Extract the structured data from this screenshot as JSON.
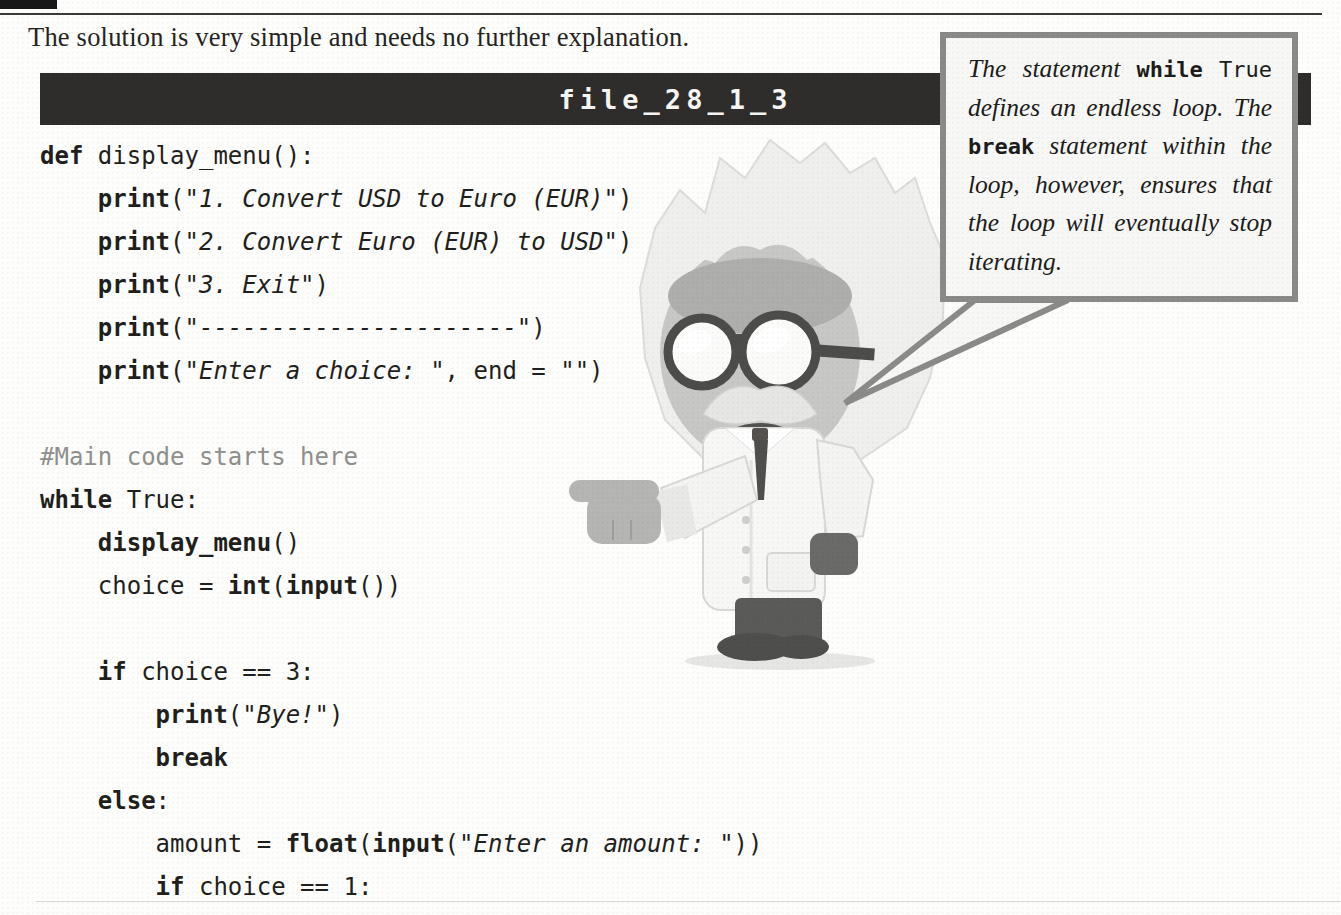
{
  "page": {
    "intro": "The solution is very simple and needs no further explanation.",
    "listing": {
      "title": "file_28_1_3",
      "language": "python",
      "lines": [
        [
          {
            "s": "kw",
            "t": "def"
          },
          {
            "s": "pl",
            "t": " display_menu():"
          }
        ],
        [
          {
            "s": "pl",
            "t": "    "
          },
          {
            "s": "kw",
            "t": "print"
          },
          {
            "s": "pl",
            "t": "(\""
          },
          {
            "s": "str",
            "t": "1. Convert USD to Euro (EUR)"
          },
          {
            "s": "pl",
            "t": "\")"
          }
        ],
        [
          {
            "s": "pl",
            "t": "    "
          },
          {
            "s": "kw",
            "t": "print"
          },
          {
            "s": "pl",
            "t": "(\""
          },
          {
            "s": "str",
            "t": "2. Convert Euro (EUR) to USD"
          },
          {
            "s": "pl",
            "t": "\")"
          }
        ],
        [
          {
            "s": "pl",
            "t": "    "
          },
          {
            "s": "kw",
            "t": "print"
          },
          {
            "s": "pl",
            "t": "(\""
          },
          {
            "s": "str",
            "t": "3. Exit"
          },
          {
            "s": "pl",
            "t": "\")"
          }
        ],
        [
          {
            "s": "pl",
            "t": "    "
          },
          {
            "s": "kw",
            "t": "print"
          },
          {
            "s": "pl",
            "t": "(\""
          },
          {
            "s": "str",
            "t": "----------------------"
          },
          {
            "s": "pl",
            "t": "\")"
          }
        ],
        [
          {
            "s": "pl",
            "t": "    "
          },
          {
            "s": "kw",
            "t": "print"
          },
          {
            "s": "pl",
            "t": "(\""
          },
          {
            "s": "str",
            "t": "Enter a choice: "
          },
          {
            "s": "pl",
            "t": "\", end = \"\")"
          }
        ],
        [],
        [
          {
            "s": "cmt",
            "t": "#Main code starts here"
          }
        ],
        [
          {
            "s": "kw",
            "t": "while"
          },
          {
            "s": "pl",
            "t": " True:"
          }
        ],
        [
          {
            "s": "pl",
            "t": "    "
          },
          {
            "s": "kw",
            "t": "display_menu"
          },
          {
            "s": "pl",
            "t": "()"
          }
        ],
        [
          {
            "s": "pl",
            "t": "    choice = "
          },
          {
            "s": "kw",
            "t": "int"
          },
          {
            "s": "pl",
            "t": "("
          },
          {
            "s": "kw",
            "t": "input"
          },
          {
            "s": "pl",
            "t": "())"
          }
        ],
        [],
        [
          {
            "s": "pl",
            "t": "    "
          },
          {
            "s": "kw",
            "t": "if"
          },
          {
            "s": "pl",
            "t": " choice == 3:"
          }
        ],
        [
          {
            "s": "pl",
            "t": "        "
          },
          {
            "s": "kw",
            "t": "print"
          },
          {
            "s": "pl",
            "t": "(\""
          },
          {
            "s": "str",
            "t": "Bye!"
          },
          {
            "s": "pl",
            "t": "\")"
          }
        ],
        [
          {
            "s": "pl",
            "t": "        "
          },
          {
            "s": "kw",
            "t": "break"
          }
        ],
        [
          {
            "s": "pl",
            "t": "    "
          },
          {
            "s": "kw",
            "t": "else"
          },
          {
            "s": "pl",
            "t": ":"
          }
        ],
        [
          {
            "s": "pl",
            "t": "        amount = "
          },
          {
            "s": "kw",
            "t": "float"
          },
          {
            "s": "pl",
            "t": "("
          },
          {
            "s": "kw",
            "t": "input"
          },
          {
            "s": "pl",
            "t": "(\""
          },
          {
            "s": "str",
            "t": "Enter an amount: "
          },
          {
            "s": "pl",
            "t": "\"))"
          }
        ],
        [
          {
            "s": "pl",
            "t": "        "
          },
          {
            "s": "kw",
            "t": "if"
          },
          {
            "s": "pl",
            "t": " choice == 1:"
          }
        ]
      ]
    },
    "bubble": {
      "full_text": "The statement while True defines an endless loop. The break statement within the loop, however, ensures that the loop will eventually stop iterating.",
      "lines": [
        {
          "tokens": [
            {
              "s": "i",
              "t": "The"
            },
            {
              "s": "i",
              "t": "statement"
            },
            {
              "s": "bm",
              "t": "while"
            },
            {
              "s": "m",
              "t": "True"
            }
          ]
        },
        {
          "tokens": [
            {
              "s": "i",
              "t": "defines"
            },
            {
              "s": "i",
              "t": "an"
            },
            {
              "s": "i",
              "t": "endless"
            },
            {
              "s": "i",
              "t": "loop."
            },
            {
              "s": "i",
              "t": "The"
            }
          ]
        },
        {
          "tokens": [
            {
              "s": "bm",
              "t": "break"
            },
            {
              "s": "i",
              "t": "statement"
            },
            {
              "s": "i",
              "t": "within"
            },
            {
              "s": "i",
              "t": "the"
            }
          ]
        },
        {
          "tokens": [
            {
              "s": "i",
              "t": "loop,"
            },
            {
              "s": "i",
              "t": "however,"
            },
            {
              "s": "i",
              "t": "ensures"
            },
            {
              "s": "i",
              "t": "that"
            }
          ]
        },
        {
          "tokens": [
            {
              "s": "i",
              "t": "the"
            },
            {
              "s": "i",
              "t": "loop"
            },
            {
              "s": "i",
              "t": "will"
            },
            {
              "s": "i",
              "t": "eventually"
            },
            {
              "s": "i",
              "t": "stop"
            }
          ]
        },
        {
          "tokens": [
            {
              "s": "i",
              "t": "iterating."
            }
          ],
          "last": true
        }
      ]
    },
    "character": {
      "name": "professor-mascot"
    },
    "colors": {
      "header_bar": "#2e2d2b",
      "header_text": "#f6f6f4",
      "bubble_border": "#8a8a88",
      "bubble_bg": "#f7f7f5",
      "code_text": "#1f1f1d",
      "comment_text": "#8f8f8d"
    }
  }
}
